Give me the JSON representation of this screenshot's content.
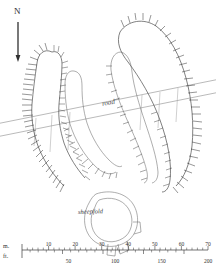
{
  "figure": {
    "type": "archaeological-earthwork-plan",
    "title": "",
    "background_color": "#ffffff",
    "ink_color": "#3a3a3a"
  },
  "north_arrow": {
    "label": "N",
    "name": "north-arrow",
    "orientation": "up",
    "x": 17,
    "y": 10,
    "length": 42
  },
  "labels": {
    "road": "road",
    "sheepfold": "sheepfold"
  },
  "scale_bar": {
    "name": "scale-bar",
    "metric": {
      "unit_label": "m.",
      "ticks": [
        0,
        10,
        20,
        30,
        40,
        50,
        60,
        70
      ],
      "tick_labels": [
        "",
        "10",
        "20",
        "30",
        "40",
        "50",
        "60",
        "70"
      ],
      "max": 70
    },
    "imperial": {
      "unit_label": "ft.",
      "ticks": [
        0,
        50,
        100,
        150,
        200
      ],
      "tick_labels": [
        "",
        "50",
        "100",
        "150",
        "200"
      ],
      "max": 200
    },
    "x_start": 22,
    "x_end": 208,
    "y": 250
  },
  "features": [
    {
      "name": "west-bank-outer",
      "kind": "hachured-bank",
      "description": "long curved bank with hachures on west side, hooking north"
    },
    {
      "name": "west-bank-inner",
      "kind": "plain-bank",
      "description": "inner curved bank parallel to west outer bank"
    },
    {
      "name": "east-bank-outer",
      "kind": "hachured-bank",
      "description": "long curved bank with hachures on east side"
    },
    {
      "name": "east-bank-inner",
      "kind": "plain-bank",
      "description": "inner curved bank parallel to east outer bank"
    },
    {
      "name": "road",
      "kind": "track",
      "description": "double-line road crossing the plan diagonally from SW to NE"
    },
    {
      "name": "sheepfold-enclosure",
      "kind": "circular-enclosure",
      "description": "sub-circular banked enclosure with entrance gap at south"
    }
  ],
  "chart_data": {
    "type": "scatter",
    "xlabel": "",
    "ylabel": "",
    "categories": [
      "west-bank-outer",
      "west-bank-inner",
      "east-bank-outer",
      "east-bank-inner",
      "road",
      "sheepfold-enclosure"
    ],
    "values": [
      1,
      1,
      1,
      1,
      1,
      1
    ],
    "annotations": [
      "N",
      "road",
      "sheepfold",
      "m.",
      "ft."
    ]
  }
}
